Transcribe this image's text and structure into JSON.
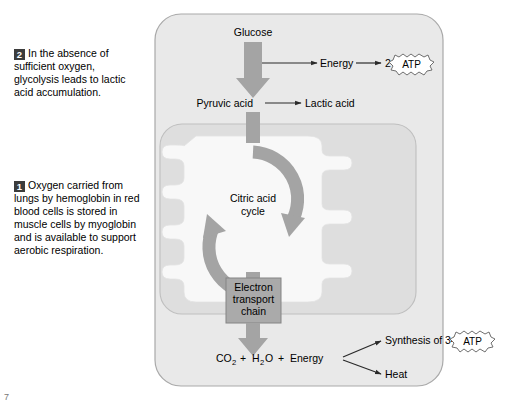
{
  "figure": {
    "colors": {
      "cell_fill": "#e8e8e8",
      "cell_stroke": "#a8a8a8",
      "mitochondrion_fill": "#dedede",
      "mitochondrion_inner_fill": "#f7f7f7",
      "mitochondrion_stroke": "#bdbdbd",
      "arrow_gray": "#a0a0a0",
      "etc_box_fill": "#a8a8a8",
      "etc_box_stroke": "#808080",
      "thin_arrow": "#2a2a2a",
      "badge_number": "#3c3c3c",
      "text": "#000000",
      "page_background": "#ffffff"
    }
  },
  "callouts": [
    {
      "number": "2",
      "text": "In the absence of sufficient oxygen, glycolysis leads to lactic acid accumulation."
    },
    {
      "number": "1",
      "text": "Oxygen carried from lungs by hemoglobin in red blood cells is stored in muscle cells by myoglobin and is available to support aerobic respiration."
    }
  ],
  "diagram": {
    "glucose": "Glucose",
    "energy_top": "Energy",
    "atp_top_count": "2",
    "atp_top_label": "ATP",
    "pyruvic_acid": "Pyruvic acid",
    "lactic_acid": "Lactic acid",
    "citric_acid_cycle_line1": "Citric acid",
    "citric_acid_cycle_line2": "cycle",
    "etc_line1": "Electron",
    "etc_line2": "transport",
    "etc_line3": "chain",
    "products": {
      "co2": "CO",
      "co2_sub": "2",
      "plus1": "+",
      "h2o_a": "H",
      "h2o_sub": "2",
      "h2o_b": "O",
      "plus2": "+",
      "energy": "Energy"
    },
    "synthesis_label": "Synthesis of 34",
    "atp_bottom_label": "ATP",
    "heat_label": "Heat"
  },
  "page": {
    "bottom_mark": "7"
  }
}
